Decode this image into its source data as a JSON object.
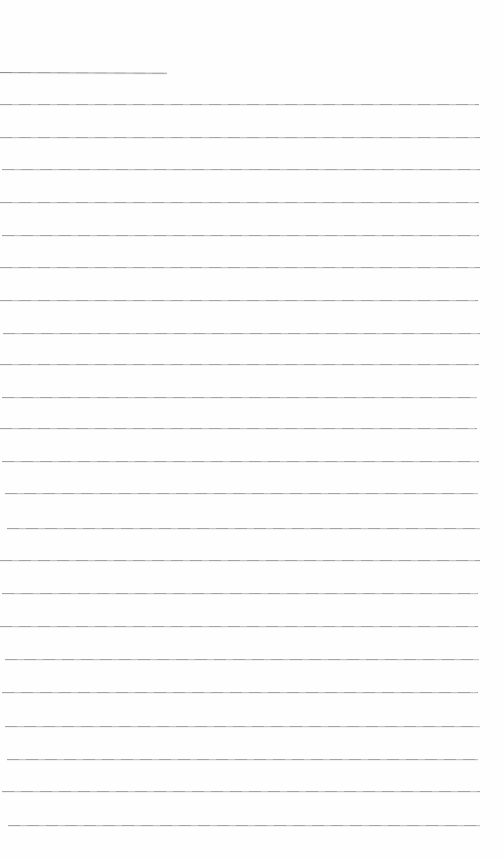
{
  "document": {
    "kind": "blank-lined-notebook-page",
    "page_width": 504,
    "page_height": 861,
    "background_color": "#fefefe",
    "rule_color_dark": "#a4a4a4",
    "rule_color_light": "#c3c3c3",
    "title_underline_color": "#8f8f8f",
    "title_underline": {
      "y": 72,
      "x_start": 0,
      "x_end": 167,
      "tilt_deg": 0.3
    },
    "ruled_lines": [
      {
        "y": 104,
        "x_start": 0,
        "x_end": 479
      },
      {
        "y": 137,
        "x_start": 0,
        "x_end": 480
      },
      {
        "y": 169,
        "x_start": 2,
        "x_end": 480
      },
      {
        "y": 202,
        "x_start": 0,
        "x_end": 479
      },
      {
        "y": 235,
        "x_start": 2,
        "x_end": 479
      },
      {
        "y": 267,
        "x_start": 0,
        "x_end": 480
      },
      {
        "y": 300,
        "x_start": 0,
        "x_end": 478
      },
      {
        "y": 333,
        "x_start": 3,
        "x_end": 480
      },
      {
        "y": 364,
        "x_start": 0,
        "x_end": 479
      },
      {
        "y": 397,
        "x_start": 2,
        "x_end": 477
      },
      {
        "y": 428,
        "x_start": 0,
        "x_end": 477
      },
      {
        "y": 461,
        "x_start": 2,
        "x_end": 479
      },
      {
        "y": 493,
        "x_start": 5,
        "x_end": 478
      },
      {
        "y": 528,
        "x_start": 7,
        "x_end": 480
      },
      {
        "y": 560,
        "x_start": 0,
        "x_end": 480
      },
      {
        "y": 593,
        "x_start": 2,
        "x_end": 478
      },
      {
        "y": 626,
        "x_start": 0,
        "x_end": 478
      },
      {
        "y": 659,
        "x_start": 5,
        "x_end": 479
      },
      {
        "y": 692,
        "x_start": 2,
        "x_end": 478
      },
      {
        "y": 726,
        "x_start": 5,
        "x_end": 480
      },
      {
        "y": 759,
        "x_start": 7,
        "x_end": 478
      },
      {
        "y": 791,
        "x_start": 2,
        "x_end": 480
      },
      {
        "y": 825,
        "x_start": 8,
        "x_end": 480
      }
    ]
  }
}
